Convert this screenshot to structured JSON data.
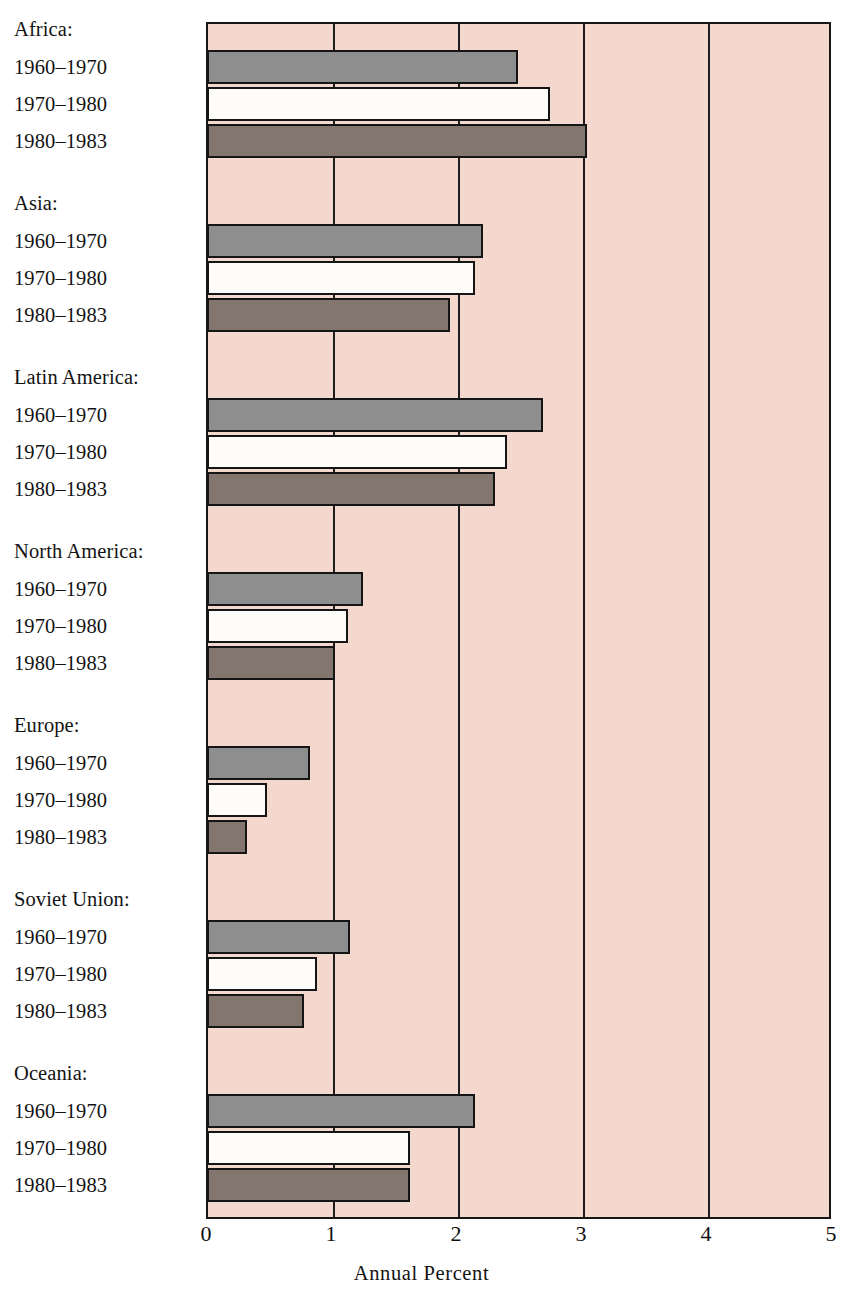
{
  "chart_data": {
    "type": "bar",
    "orientation": "horizontal",
    "title": "",
    "xlabel": "Annual Percent",
    "ylabel": "",
    "xlim": [
      0,
      5
    ],
    "xticks": [
      "0",
      "1",
      "2",
      "3",
      "4",
      "5"
    ],
    "grid": true,
    "legend": "none",
    "series": [
      {
        "name": "1960–1970",
        "key": "s0",
        "color": "#8e8e8e"
      },
      {
        "name": "1970–1980",
        "key": "s1",
        "color": "#fdfcf8"
      },
      {
        "name": "1980–1983",
        "key": "s2",
        "color": "#82766f"
      }
    ],
    "groups": [
      {
        "label": "Africa:",
        "values": [
          2.47,
          2.73,
          3.02
        ]
      },
      {
        "label": "Asia:",
        "values": [
          2.19,
          2.13,
          1.93
        ]
      },
      {
        "label": "Latin America:",
        "values": [
          2.67,
          2.38,
          2.29
        ]
      },
      {
        "label": "North America:",
        "values": [
          1.23,
          1.11,
          1.01
        ]
      },
      {
        "label": "Europe:",
        "values": [
          0.81,
          0.46,
          0.3
        ]
      },
      {
        "label": "Soviet Union:",
        "values": [
          1.13,
          0.86,
          0.76
        ]
      },
      {
        "label": "Oceania:",
        "values": [
          2.13,
          1.61,
          1.61
        ]
      }
    ]
  },
  "axis": {
    "title": "Annual Percent",
    "ticks": [
      "0",
      "1",
      "2",
      "3",
      "4",
      "5"
    ]
  },
  "colors": {
    "plot_background": "#f4d7cd",
    "frame": "#171717",
    "series_1960_1970": "#8e8e8e",
    "series_1970_1980": "#fdfcf8",
    "series_1980_1983": "#82766f",
    "page_background": "#ffffff"
  }
}
